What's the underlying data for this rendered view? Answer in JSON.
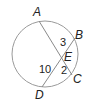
{
  "diagram": {
    "type": "circle-intersecting-chords",
    "colors": {
      "circle": "#9a9a9a",
      "chords": "#8a8a8a",
      "text": "#222222",
      "background": "#ffffff"
    },
    "circle": {
      "cx": 45,
      "cy": 54,
      "r": 33
    },
    "points": {
      "A": {
        "label": "A",
        "x": 39,
        "y": 21,
        "lx": 33,
        "ly": 16
      },
      "B": {
        "label": "B",
        "x": 75,
        "y": 38,
        "lx": 75,
        "ly": 39
      },
      "C": {
        "label": "C",
        "x": 72,
        "y": 75,
        "lx": 73,
        "ly": 83
      },
      "D": {
        "label": "D",
        "x": 42,
        "y": 87,
        "lx": 35,
        "ly": 99
      },
      "E": {
        "label": "E",
        "x": 63,
        "y": 56,
        "lx": 64,
        "ly": 61
      }
    },
    "segments": [
      {
        "name": "AC",
        "from": "A",
        "to": "C"
      },
      {
        "name": "BD",
        "from": "B",
        "to": "D"
      }
    ],
    "lengths": {
      "EB": {
        "value": "3",
        "x": 60,
        "y": 46
      },
      "EC": {
        "value": "2",
        "x": 61,
        "y": 74
      },
      "DE": {
        "value": "10",
        "x": 39,
        "y": 73
      }
    }
  }
}
